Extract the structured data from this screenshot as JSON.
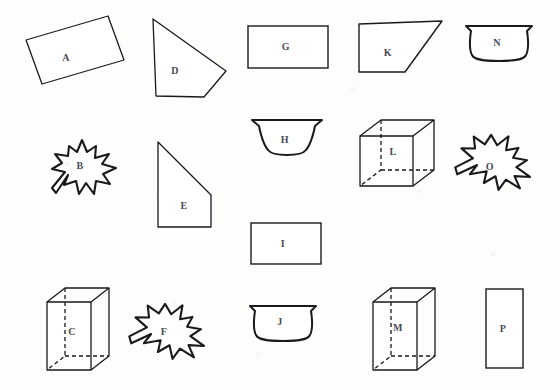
{
  "page": {
    "background_color": "#fdfdfc",
    "ink_color": "#1a1a1a",
    "label_color": "#4a4a52",
    "width": 560,
    "height": 390
  },
  "shapes": [
    {
      "id": "A",
      "label": "A",
      "kind": "tilted-rectangle",
      "row": 1,
      "col": 1,
      "label_x": 66,
      "label_y": 57
    },
    {
      "id": "D",
      "label": "D",
      "kind": "pentagon-arrow",
      "row": 1,
      "col": 2,
      "label_x": 175,
      "label_y": 70
    },
    {
      "id": "G",
      "label": "G",
      "kind": "rectangle",
      "row": 1,
      "col": 3,
      "label_x": 286,
      "label_y": 46
    },
    {
      "id": "K",
      "label": "K",
      "kind": "right-trapezoid",
      "row": 1,
      "col": 4,
      "label_x": 388,
      "label_y": 52
    },
    {
      "id": "N",
      "label": "N",
      "kind": "bowl",
      "row": 1,
      "col": 5,
      "label_x": 497,
      "label_y": 42
    },
    {
      "id": "B",
      "label": "B",
      "kind": "leaf-upright",
      "row": 2,
      "col": 1,
      "label_x": 80,
      "label_y": 165
    },
    {
      "id": "E",
      "label": "E",
      "kind": "slant-top-trapezoid",
      "row": 2,
      "col": 2,
      "label_x": 184,
      "label_y": 205
    },
    {
      "id": "H",
      "label": "H",
      "kind": "wide-bowl",
      "row": 2,
      "col": 3,
      "label_x": 285,
      "label_y": 139
    },
    {
      "id": "L",
      "label": "L",
      "kind": "cube",
      "row": 2,
      "col": 4,
      "label_x": 393,
      "label_y": 151
    },
    {
      "id": "O",
      "label": "O",
      "kind": "leaf-rotated",
      "row": 2,
      "col": 5,
      "label_x": 490,
      "label_y": 166
    },
    {
      "id": "I",
      "label": "I",
      "kind": "rectangle",
      "row": 3,
      "col": 3,
      "label_x": 283,
      "label_y": 243
    },
    {
      "id": "C",
      "label": "C",
      "kind": "rect-prism",
      "row": 4,
      "col": 1,
      "label_x": 72,
      "label_y": 331
    },
    {
      "id": "F",
      "label": "F",
      "kind": "leaf-rotated",
      "row": 4,
      "col": 2,
      "label_x": 164,
      "label_y": 331
    },
    {
      "id": "J",
      "label": "J",
      "kind": "bowl",
      "row": 4,
      "col": 3,
      "label_x": 280,
      "label_y": 321
    },
    {
      "id": "M",
      "label": "M",
      "kind": "rect-prism",
      "row": 4,
      "col": 4,
      "label_x": 398,
      "label_y": 327
    },
    {
      "id": "P",
      "label": "P",
      "kind": "tall-rectangle",
      "row": 4,
      "col": 5,
      "label_x": 503,
      "label_y": 328
    }
  ]
}
